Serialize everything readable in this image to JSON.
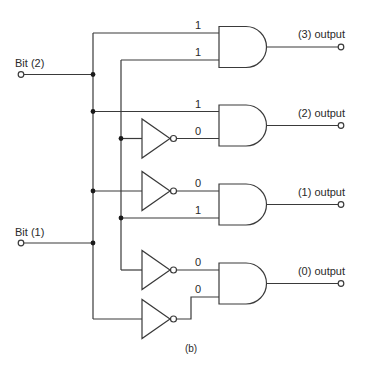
{
  "diagram": {
    "caption": "(b)",
    "inputs": [
      {
        "label": "Bit (2)"
      },
      {
        "label": "Bit (1)"
      }
    ],
    "outputs": [
      {
        "label": "(3) output"
      },
      {
        "label": "(2) output"
      },
      {
        "label": "(1) output"
      },
      {
        "label": "(0) output"
      }
    ],
    "gates": [
      {
        "name": "and-gate-3",
        "inputs": [
          "1",
          "1"
        ]
      },
      {
        "name": "and-gate-2",
        "inputs": [
          "1",
          "0"
        ]
      },
      {
        "name": "and-gate-1",
        "inputs": [
          "0",
          "1"
        ]
      },
      {
        "name": "and-gate-0",
        "inputs": [
          "0",
          "0"
        ]
      }
    ],
    "colors": {
      "line": "#3a3a3a",
      "junction": "#1a1a1a",
      "background": "#ffffff"
    }
  }
}
